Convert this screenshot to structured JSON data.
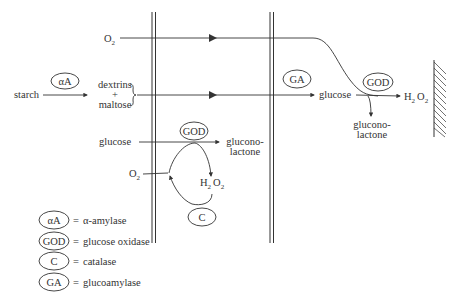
{
  "diagram": {
    "species": {
      "o2_top": {
        "main": "O",
        "sub": "2"
      },
      "starch": "starch",
      "dextrins": "dextrins",
      "plus": "+",
      "maltose": "maltose",
      "glucose_mid": "glucose",
      "gluconolactone_mid_1": "glucono-",
      "gluconolactone_mid_2": "lactone",
      "o2_mid": {
        "main": "O",
        "sub": "2"
      },
      "h2o2_mid": {
        "h": "H",
        "h_sub": "2",
        "o": "O",
        "o_sub": "2"
      },
      "glucose_right": "glucose",
      "gluconolactone_right_1": "glucono-",
      "gluconolactone_right_2": "lactone",
      "h2o2_right": {
        "h": "H",
        "h_sub": "2",
        "o": "O",
        "o_sub": "2"
      }
    },
    "enzymes": {
      "aA_top": "αA",
      "GOD_mid": "GOD",
      "C_mid": "C",
      "GA_right": "GA",
      "GOD_right": "GOD"
    },
    "legend": [
      {
        "abbr": "αA",
        "eq": "=",
        "name": "α-amylase"
      },
      {
        "abbr": "GOD",
        "eq": "=",
        "name": "glucose oxidase"
      },
      {
        "abbr": "C",
        "eq": "=",
        "name": "catalase"
      },
      {
        "abbr": "GA",
        "eq": "=",
        "name": "glucoamylase"
      }
    ]
  }
}
